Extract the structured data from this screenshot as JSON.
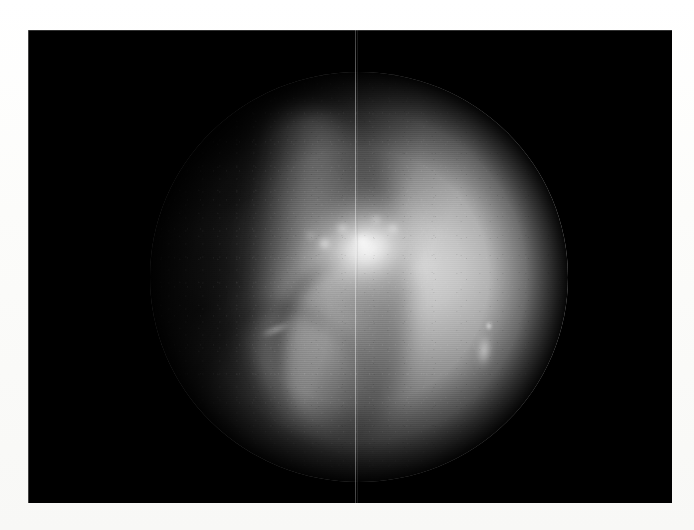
{
  "page": {
    "width": 694,
    "height": 530,
    "background_color": "#fdfdfb",
    "media_type": "scanned-figure",
    "caption": ""
  },
  "figure": {
    "name": "endoscopic-image",
    "modality": "endoscopy",
    "color_mode": "grayscale",
    "frame": {
      "background_color": "#000000",
      "left": 28,
      "top": 30,
      "width": 644,
      "height": 473
    },
    "field_of_view": {
      "shape": "circle",
      "center_x": 359,
      "center_y": 277,
      "radius_x": 209,
      "radius_y": 205,
      "vignette": true
    },
    "illumination": {
      "hotspot_x": 420,
      "hotspot_y": 277,
      "brightest_value": "#ffffff",
      "midtone_value": "#a6a6a6",
      "shadow_value": "#1a1a1a"
    },
    "features": [
      {
        "name": "specular-highlight-main",
        "description": "Dominant saturated specular reflection from moist tissue, center-right of the field",
        "center_x": 420,
        "center_y": 277,
        "intensity": "#ffffff"
      },
      {
        "name": "specular-highlight-secondary",
        "description": "Small vertical bright streak on the right side of the field",
        "center_x": 495,
        "center_y": 355,
        "intensity": "#f2f2f2"
      },
      {
        "name": "tissue-ridge",
        "description": "Elongated pale fold or ridge running diagonally from upper-centre to lower-centre",
        "orientation_degrees": -9,
        "intensity": "#c8c8c8"
      },
      {
        "name": "dark-cavity-upper-left",
        "description": "Unlit recess occupying the upper-left quadrant of the circular field",
        "intensity": "#101010"
      },
      {
        "name": "dark-pocket-left",
        "description": "Deep shadowed pocket at mid-left of the field",
        "center_x": 226,
        "center_y": 310,
        "intensity": "#0c0c0c"
      },
      {
        "name": "lower-crease",
        "description": "Soft curved crease across the lower-left of the field",
        "intensity": "#3a3a3a"
      }
    ],
    "artifacts": [
      {
        "name": "vertical-scanline",
        "description": "Faint pale vertical line spanning the full height of the captured frame",
        "x": 355,
        "color": "#e6e6e6"
      },
      {
        "name": "interlace-texture",
        "description": "Horizontal interlace banding from the analogue video capture"
      },
      {
        "name": "film-grain",
        "description": "Fine speckle noise across the illuminated tissue"
      }
    ]
  }
}
